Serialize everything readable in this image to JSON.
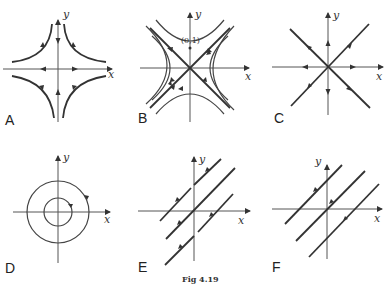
{
  "figure": {
    "caption": "Fig 4.19",
    "panels": [
      {
        "id": "A",
        "label": "A",
        "x_label": "x",
        "y_label": "y",
        "description": "saddle with hyperbolic trajectories in each quadrant; flow inward along y-axis, outward along x-axis"
      },
      {
        "id": "B",
        "label": "B",
        "x_label": "x",
        "y_label": "y",
        "point_label": "(0,1)",
        "description": "saddle with diagonal separatrices and hyperbolas; trajectory through (0,1)"
      },
      {
        "id": "C",
        "label": "C",
        "x_label": "x",
        "y_label": "y",
        "description": "star node (unstable), radial lines outward"
      },
      {
        "id": "D",
        "label": "D",
        "x_label": "x",
        "y_label": "y",
        "description": "center with concentric circles, clockwise flow"
      },
      {
        "id": "E",
        "label": "E",
        "x_label": "x",
        "y_label": "y",
        "description": "parallel diagonal lines with flow up-right"
      },
      {
        "id": "F",
        "label": "F",
        "x_label": "x",
        "y_label": "y",
        "description": "parallel diagonal lines with flow up-right"
      }
    ]
  }
}
